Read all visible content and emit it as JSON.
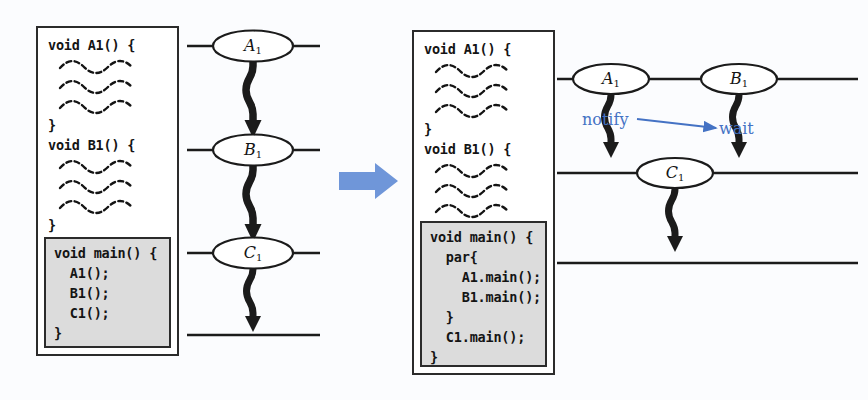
{
  "figure": {
    "kind": "before-after-transformation-diagram",
    "background_color": "#fbfcfe",
    "transform_arrow": {
      "name": "transform-arrow",
      "color": "#6f96d9",
      "direction": "right"
    }
  },
  "left_panel": {
    "code_box": {
      "lines": [
        "void A1() {",
        "~~~",
        "~~~",
        "~~~",
        "}",
        "void B1() {",
        "~~~",
        "~~~",
        "~~~",
        "}",
        "void C1() {",
        "~~~",
        "~~~",
        "~~~",
        "}"
      ],
      "main_block": {
        "background_color": "#dcdcdc",
        "lines": [
          "void main() {",
          "  A1();",
          "  B1();",
          "  C1();",
          "}"
        ]
      }
    },
    "diagram": {
      "nodes": [
        {
          "label": "A",
          "sub": "1"
        },
        {
          "label": "B",
          "sub": "1"
        },
        {
          "label": "C",
          "sub": "1"
        }
      ],
      "arrows": 4,
      "rails": 4
    }
  },
  "right_panel": {
    "code_box": {
      "lines": [
        "void A1() {",
        "~~~",
        "~~~",
        "~~~",
        "}",
        "void B1() {",
        "~~~",
        "~~~",
        "~~~",
        "}",
        "void C1() {",
        "~~~",
        "~~~",
        "~~~",
        "}"
      ],
      "main_block": {
        "background_color": "#dcdcdc",
        "lines": [
          "void main() {",
          "  par{",
          "    A1.main();",
          "    B1.main();",
          "  }",
          "  C1.main();",
          "}"
        ]
      }
    },
    "diagram": {
      "nodes": [
        {
          "label": "A",
          "sub": "1"
        },
        {
          "label": "B",
          "sub": "1"
        },
        {
          "label": "C",
          "sub": "1"
        }
      ],
      "annotations": {
        "notify": "notify",
        "wait": "wait",
        "color": "#4472c4"
      },
      "arrows": 3,
      "rails": 2
    }
  }
}
